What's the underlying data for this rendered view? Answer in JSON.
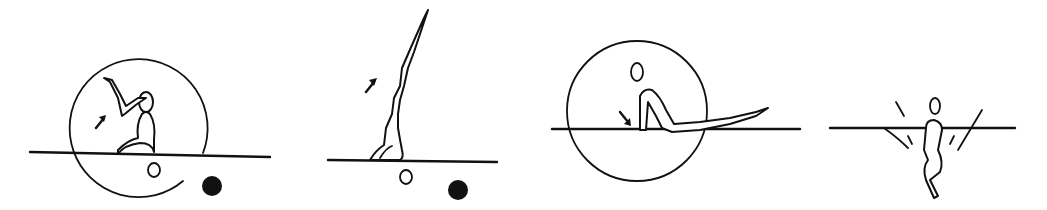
{
  "figure": {
    "panels": [
      {
        "id": 1,
        "pose": "seated, leg raised overhead inside circle",
        "arrow": "up-left",
        "markers": [
          "hollow-oval",
          "filled-dot"
        ],
        "circle": true
      },
      {
        "id": 2,
        "pose": "shoulder stand, legs extended vertically",
        "arrow": "up-right",
        "markers": [
          "hollow-oval",
          "filled-dot"
        ],
        "circle": false
      },
      {
        "id": 3,
        "pose": "front support with legs extended along bar inside circle",
        "arrow": "down-right",
        "markers": [
          "hollow-oval"
        ],
        "circle": true
      },
      {
        "id": 4,
        "pose": "hanging tuck below bar",
        "arrow": "none",
        "markers": [
          "hollow-oval"
        ],
        "circle": false
      }
    ]
  },
  "colors": {
    "ink": "#111111",
    "paper": "#ffffff"
  }
}
